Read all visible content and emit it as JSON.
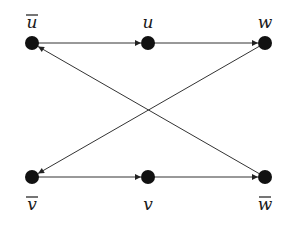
{
  "diagram": {
    "type": "directed-graph",
    "nodes": [
      {
        "id": "ubar",
        "label": "u",
        "overline": true,
        "x": 32,
        "y": 43,
        "label_pos": "above"
      },
      {
        "id": "u",
        "label": "u",
        "overline": false,
        "x": 148,
        "y": 43,
        "label_pos": "above"
      },
      {
        "id": "w",
        "label": "w",
        "overline": false,
        "x": 265,
        "y": 43,
        "label_pos": "above"
      },
      {
        "id": "vbar",
        "label": "v",
        "overline": true,
        "x": 32,
        "y": 177,
        "label_pos": "below"
      },
      {
        "id": "v",
        "label": "v",
        "overline": false,
        "x": 148,
        "y": 177,
        "label_pos": "below"
      },
      {
        "id": "wbar",
        "label": "w",
        "overline": true,
        "x": 265,
        "y": 177,
        "label_pos": "below"
      }
    ],
    "edges": [
      {
        "from": "ubar",
        "to": "u"
      },
      {
        "from": "u",
        "to": "w"
      },
      {
        "from": "vbar",
        "to": "v"
      },
      {
        "from": "v",
        "to": "wbar"
      },
      {
        "from": "w",
        "to": "vbar"
      },
      {
        "from": "wbar",
        "to": "ubar"
      }
    ]
  }
}
